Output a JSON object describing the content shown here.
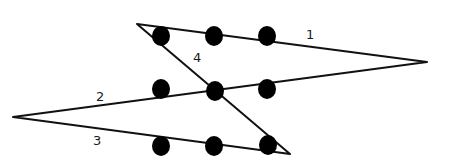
{
  "diagram": {
    "type": "nine-dots-four-lines-puzzle",
    "colors": {
      "line": "#111111",
      "dot": "#000000",
      "background": "#ffffff"
    },
    "path": [
      {
        "x": 137,
        "y": 24
      },
      {
        "x": 427,
        "y": 62
      },
      {
        "x": 13,
        "y": 117
      },
      {
        "x": 290,
        "y": 154
      },
      {
        "x": 137,
        "y": 24
      }
    ],
    "dots": [
      {
        "x": 161,
        "y": 36
      },
      {
        "x": 214,
        "y": 36
      },
      {
        "x": 267,
        "y": 36
      },
      {
        "x": 161,
        "y": 89
      },
      {
        "x": 215,
        "y": 91
      },
      {
        "x": 267,
        "y": 89
      },
      {
        "x": 161,
        "y": 146
      },
      {
        "x": 214,
        "y": 146
      },
      {
        "x": 268,
        "y": 145
      }
    ],
    "labels": [
      {
        "text": "1",
        "x": 306,
        "y": 39
      },
      {
        "text": "2",
        "x": 96,
        "y": 101
      },
      {
        "text": "3",
        "x": 93,
        "y": 145
      },
      {
        "text": "4",
        "x": 193,
        "y": 62
      }
    ]
  }
}
